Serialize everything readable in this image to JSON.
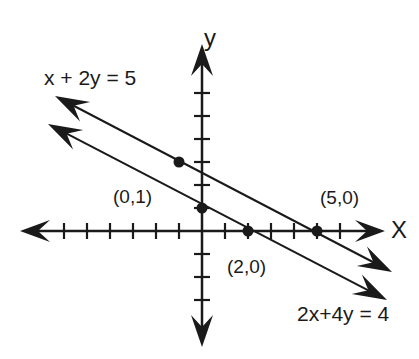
{
  "diagram": {
    "type": "coordinate-plane-lines",
    "ink_color": "#1a1a1a",
    "axes": {
      "x_label": "X",
      "y_label": "y",
      "origin_px": [
        202,
        231
      ],
      "unit_px": 23,
      "x_ticks": [
        -6,
        -5,
        -4,
        -3,
        -2,
        -1,
        1,
        2,
        3,
        4,
        5,
        6
      ],
      "y_ticks": [
        -3,
        -2,
        -1,
        1,
        2,
        3,
        4,
        5,
        6
      ]
    },
    "lines": [
      {
        "equation": "x + 2y = 5",
        "label": "x + 2y = 5",
        "from_px": [
          55,
          96
        ],
        "to_px": [
          392,
          272
        ]
      },
      {
        "equation": "2x + 4y = 4",
        "label": "2x+4y = 4",
        "from_px": [
          48,
          124
        ],
        "to_px": [
          387,
          300
        ]
      }
    ],
    "points": [
      {
        "label": "(0,1)",
        "x": 0,
        "y": 1,
        "labelled": true
      },
      {
        "label": "(2,0)",
        "x": 2,
        "y": 0,
        "labelled": true
      },
      {
        "label": "(5,0)",
        "x": 5,
        "y": 0,
        "labelled": true
      },
      {
        "label": "",
        "x": -1,
        "y": 3,
        "labelled": false
      }
    ]
  }
}
